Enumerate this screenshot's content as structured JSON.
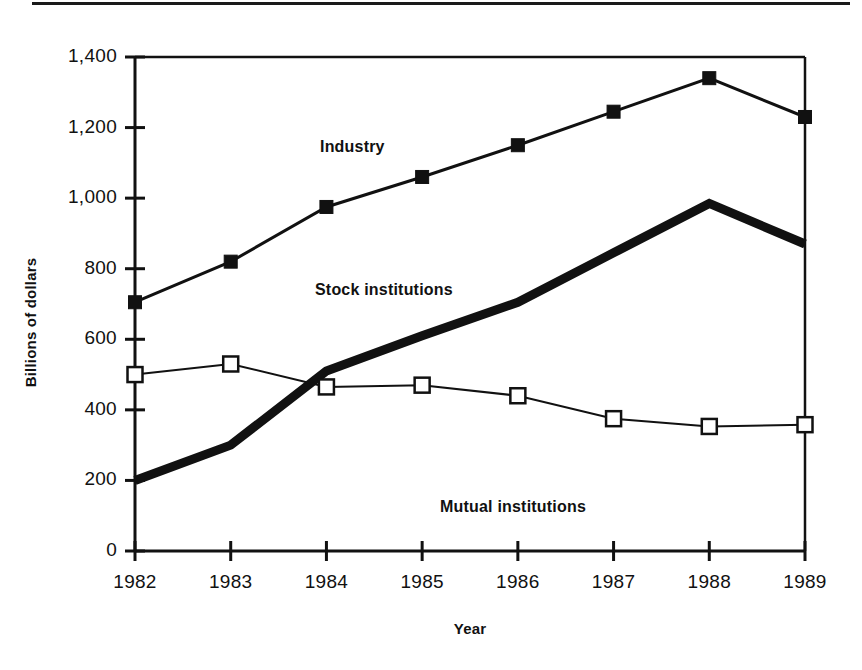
{
  "figure": {
    "background_color": "#ffffff",
    "ink_color": "#111111",
    "has_top_rule": true
  },
  "chart_data": {
    "type": "line",
    "title": "",
    "subtitle": "",
    "xlabel": "Year",
    "ylabel": "Billions of dollars",
    "categories": [
      "1982",
      "1983",
      "1984",
      "1985",
      "1986",
      "1987",
      "1988",
      "1989"
    ],
    "x": [
      1982,
      1983,
      1984,
      1985,
      1986,
      1987,
      1988,
      1989
    ],
    "xlim": [
      1982,
      1989
    ],
    "ylim": [
      0,
      1400
    ],
    "ytick_values": [
      0,
      200,
      400,
      600,
      800,
      1000,
      1200,
      1400
    ],
    "ytick_labels": [
      "0",
      "200",
      "400",
      "600",
      "800",
      "1,000",
      "1,200",
      "1,400"
    ],
    "xtick_labels": [
      "1982",
      "1983",
      "1984",
      "1985",
      "1986",
      "1987",
      "1988",
      "1989"
    ],
    "grid": false,
    "legend_position": "inline-annotations",
    "series": [
      {
        "name": "Industry",
        "marker": "filled-square",
        "line_width": 3,
        "color": "#111111",
        "values": [
          705,
          820,
          975,
          1060,
          1150,
          1245,
          1340,
          1230
        ],
        "label_position": {
          "x": 320,
          "y": 138
        }
      },
      {
        "name": "Stock institutions",
        "marker": "none",
        "line_width": 9,
        "color": "#111111",
        "values": [
          200,
          300,
          510,
          610,
          705,
          845,
          985,
          870
        ],
        "label_position": {
          "x": 315,
          "y": 281
        }
      },
      {
        "name": "Mutual institutions",
        "marker": "open-square",
        "line_width": 2,
        "color": "#111111",
        "values": [
          500,
          530,
          465,
          470,
          440,
          375,
          353,
          358
        ],
        "label_position": {
          "x": 440,
          "y": 498
        }
      }
    ],
    "annotations": [
      {
        "text": "Industry",
        "x": 320,
        "y": 138
      },
      {
        "text": "Stock institutions",
        "x": 315,
        "y": 281
      },
      {
        "text": "Mutual institutions",
        "x": 440,
        "y": 498
      }
    ]
  },
  "plot_geometry": {
    "left": 135,
    "right": 805,
    "top": 57,
    "bottom": 551
  }
}
